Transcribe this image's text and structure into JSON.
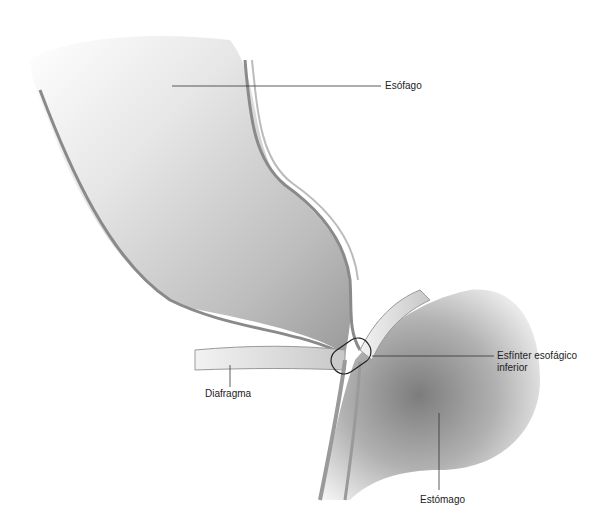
{
  "diagram": {
    "title": "",
    "labels": {
      "esofago": "Esófago",
      "esfinter_line1": "Esfínter esofágico",
      "esfinter_line2": "inferior",
      "diafragma": "Diafragma",
      "estomago": "Estómago"
    }
  }
}
